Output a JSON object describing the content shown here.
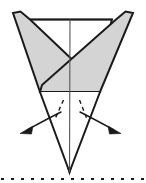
{
  "figure": {
    "name": "origami-fold-step-diagram",
    "type": "diagram",
    "title": "Origami fold step: fold both flaps outward",
    "canvas": {
      "width": 146,
      "height": 183
    },
    "colors": {
      "background": "#ffffff",
      "stroke": "#1a1a1a",
      "shade_fill": "#d4d4d4",
      "white_fill": "#ffffff",
      "thin_stroke": "#555555"
    },
    "stroke_widths": {
      "outline": 2.0,
      "center_line": 1.1,
      "arrow": 1.4,
      "dash_fold": 1.4,
      "baseline": 2.2
    },
    "labels": {
      "left_wing": "left shaded flap",
      "right_wing": "right shaded flap",
      "center_crease": "vertical center crease",
      "top_edge": "top horizontal edge",
      "body": "lower kite body",
      "left_arrow": "fold left flap outward",
      "right_arrow": "fold right flap outward",
      "left_dash": "left dashed fold line",
      "right_dash": "right dashed fold line",
      "baseline": "dotted cut/reference baseline"
    },
    "geometry": {
      "apex_bottom": [
        69.5,
        172
      ],
      "crossing_point": [
        70,
        66
      ],
      "top_left_tip": [
        13,
        13
      ],
      "top_right_tip": [
        133,
        13
      ],
      "top_edge_left": [
        30,
        19.5
      ],
      "top_edge_right": [
        112,
        19.5
      ],
      "left_wing_lower_tip": [
        40,
        92
      ],
      "right_wing_lower_tip": [
        100,
        92
      ],
      "left_wing_polygon": "13,13 20.5,11.5 30,19.5 99,85 100,92 40,92",
      "right_wing_polygon": "133,13 125.5,11.5 116,19.5 42,85 40,92 100,92",
      "body_polygon": "30,19.5 112,19.5 69.5,172",
      "center_line": [
        [
          70,
          19.5
        ],
        [
          69.5,
          172
        ]
      ],
      "left_dash": [
        [
          63.5,
          100
        ],
        [
          55,
          119
        ]
      ],
      "right_dash": [
        [
          79.5,
          100
        ],
        [
          87,
          119
        ]
      ],
      "left_arrow_path": "M61,112 Q47,119 27,130",
      "right_arrow_path": "M80,112 Q94,119 114,130",
      "left_arrow_head": "20,133.5 33,126 31.5,134",
      "right_arrow_head": "121,133.5 108,126 109.5,134",
      "baseline_y": 179,
      "baseline_dash_pattern": "3 7",
      "baseline_x_start": 1,
      "baseline_x_end": 145
    }
  }
}
